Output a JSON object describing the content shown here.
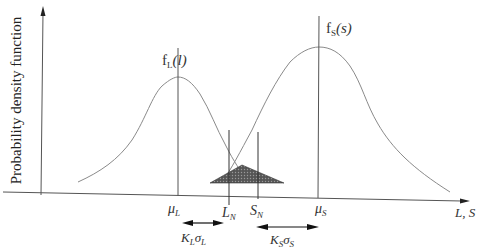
{
  "diagram": {
    "y_axis_label": "Probability density function",
    "x_axis_label": "L, S",
    "curves": [
      {
        "id": "load",
        "label_main": "f",
        "label_sub": "L",
        "label_arg": "(l)",
        "mean_label": "μ",
        "mean_sub": "L"
      },
      {
        "id": "strength",
        "label_main": "f",
        "label_sub": "S",
        "label_arg": "(s)",
        "mean_label": "μ",
        "mean_sub": "S"
      }
    ],
    "markers": [
      {
        "id": "nominal-load",
        "main": "L",
        "sub": "N"
      },
      {
        "id": "nominal-strength",
        "main": "S",
        "sub": "N"
      }
    ],
    "spans": [
      {
        "id": "load-span",
        "main": "K",
        "sub1": "L",
        "sigma": "σ",
        "sub2": "L"
      },
      {
        "id": "strength-span",
        "main": "K",
        "sub1": "S",
        "sigma": "σ",
        "sub2": "S"
      }
    ],
    "interference_region": "shaded overlap",
    "colors": {
      "axis": "#555555",
      "curve": "#8a8a8a",
      "shade": "#444444"
    }
  }
}
